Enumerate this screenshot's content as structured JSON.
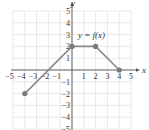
{
  "chart_data": {
    "type": "line",
    "title": "",
    "annotation": "y = f(x)",
    "xlabel": "x",
    "ylabel": "y",
    "xlim": [
      -5,
      5
    ],
    "ylim": [
      -5,
      5
    ],
    "grid": true,
    "x_ticks": [
      -5,
      -4,
      -3,
      -2,
      -1,
      1,
      2,
      3,
      4,
      5
    ],
    "y_ticks": [
      -5,
      -4,
      -3,
      -2,
      -1,
      1,
      2,
      3,
      4,
      5
    ],
    "series": [
      {
        "name": "f(x)",
        "points": [
          [
            -4,
            -2
          ],
          [
            0,
            2
          ],
          [
            2,
            2
          ],
          [
            4,
            0
          ]
        ],
        "endpoint_markers": [
          [
            -4,
            -2
          ],
          [
            0,
            2
          ],
          [
            2,
            2
          ],
          [
            4,
            0
          ]
        ]
      }
    ],
    "colors": {
      "line": "#8a8a8a",
      "marker": "#7a7a7a",
      "grid": "#d8d8d8",
      "axis": "#555555"
    }
  }
}
